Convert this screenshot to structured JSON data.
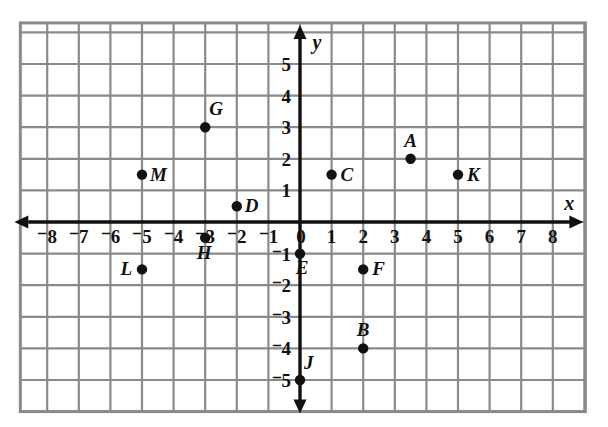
{
  "chart_data": {
    "type": "scatter",
    "title": "",
    "xlabel": "x",
    "ylabel": "y",
    "xlim": [
      -8.9,
      9.1
    ],
    "ylim": [
      -6.0,
      6.0
    ],
    "grid": true,
    "legend": "none",
    "x_ticks": [
      "⁻8",
      "⁻7",
      "⁻6",
      "⁻5",
      "⁻4",
      "⁻3",
      "⁻2",
      "⁻1",
      "0",
      "1",
      "2",
      "3",
      "4",
      "5",
      "6",
      "7",
      "8"
    ],
    "x_tick_values": [
      -8,
      -7,
      -6,
      -5,
      -4,
      -3,
      -2,
      -1,
      0,
      1,
      2,
      3,
      4,
      5,
      6,
      7,
      8
    ],
    "y_ticks": [
      "5",
      "4",
      "3",
      "2",
      "1",
      "⁻1",
      "⁻2",
      "⁻3",
      "⁻4",
      "⁻5"
    ],
    "y_tick_values": [
      5,
      4,
      3,
      2,
      1,
      -1,
      -2,
      -3,
      -4,
      -5
    ],
    "points": [
      {
        "label": "A",
        "x": 3.5,
        "y": 2.0,
        "label_dx": 0,
        "label_dy": -12,
        "anchor": "middle"
      },
      {
        "label": "B",
        "x": 2.0,
        "y": -4.0,
        "label_dx": 0,
        "label_dy": -12,
        "anchor": "middle"
      },
      {
        "label": "C",
        "x": 1.0,
        "y": 1.5,
        "label_dx": 9,
        "label_dy": 6,
        "anchor": "start"
      },
      {
        "label": "D",
        "x": -2.0,
        "y": 0.5,
        "label_dx": 8,
        "label_dy": 6,
        "anchor": "start"
      },
      {
        "label": "E",
        "x": 0.0,
        "y": -1.0,
        "label_dx": 2,
        "label_dy": 20,
        "anchor": "middle"
      },
      {
        "label": "F",
        "x": 2.0,
        "y": -1.5,
        "label_dx": 9,
        "label_dy": 6,
        "anchor": "start"
      },
      {
        "label": "G",
        "x": -3.0,
        "y": 3.0,
        "label_dx": 4,
        "label_dy": -12,
        "anchor": "start"
      },
      {
        "label": "H",
        "x": -3.0,
        "y": -0.5,
        "label_dx": -1,
        "label_dy": 21,
        "anchor": "middle"
      },
      {
        "label": "J",
        "x": 0.0,
        "y": -5.0,
        "label_dx": 4,
        "label_dy": -11,
        "anchor": "start"
      },
      {
        "label": "K",
        "x": 5.0,
        "y": 1.5,
        "label_dx": 9,
        "label_dy": 6,
        "anchor": "start"
      },
      {
        "label": "L",
        "x": -5.0,
        "y": -1.5,
        "label_dx": -10,
        "label_dy": 6,
        "anchor": "end"
      },
      {
        "label": "M",
        "x": -5.0,
        "y": 1.5,
        "label_dx": 8,
        "label_dy": 6,
        "anchor": "start"
      }
    ],
    "colors": {
      "grid": "#8a8a8a",
      "axis": "#111111",
      "point": "#111111",
      "background": "#ffffff"
    }
  }
}
